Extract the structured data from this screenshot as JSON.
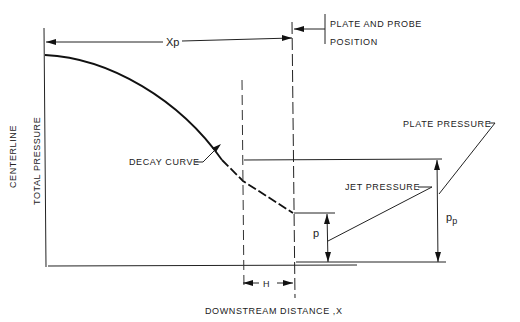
{
  "diagram": {
    "axes": {
      "y_label_line1": "CENTERLINE",
      "y_label_line2": "TOTAL PRESSURE",
      "x_label": "DOWNSTREAM  DISTANCE ,X"
    },
    "labels": {
      "xp": "Xp",
      "plate_probe_line1": "PLATE AND PROBE",
      "plate_probe_line2": "POSITION",
      "decay_curve": "DECAY CURVE",
      "plate_pressure": "PLATE PRESSURE",
      "jet_pressure": "JET PRESSURE",
      "p": "p",
      "pp_main": "p",
      "pp_sub": "p",
      "h": "H"
    },
    "colors": {
      "line": "#222222",
      "background": "#ffffff"
    }
  }
}
